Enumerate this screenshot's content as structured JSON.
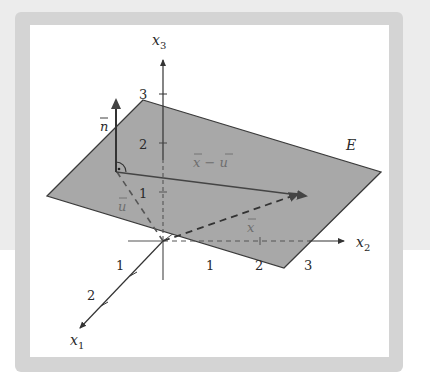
{
  "figure": {
    "plane_label": "E",
    "axes": {
      "x1": {
        "name": "x",
        "sub": "1",
        "ticks": [
          "1",
          "2"
        ]
      },
      "x2": {
        "name": "x",
        "sub": "2",
        "ticks": [
          "1",
          "2",
          "3"
        ]
      },
      "x3": {
        "name": "x",
        "sub": "3",
        "ticks": [
          "1",
          "2",
          "3"
        ]
      }
    },
    "vectors": {
      "n": "n",
      "u": "u",
      "x": "x",
      "x_minus_u": "x − u"
    },
    "colors": {
      "plane_fill": "#a8a8a8",
      "plane_edge": "#3a3a3a",
      "axis": "#333333",
      "frame": "#d4d4d4",
      "background_top": "#ececec"
    }
  }
}
